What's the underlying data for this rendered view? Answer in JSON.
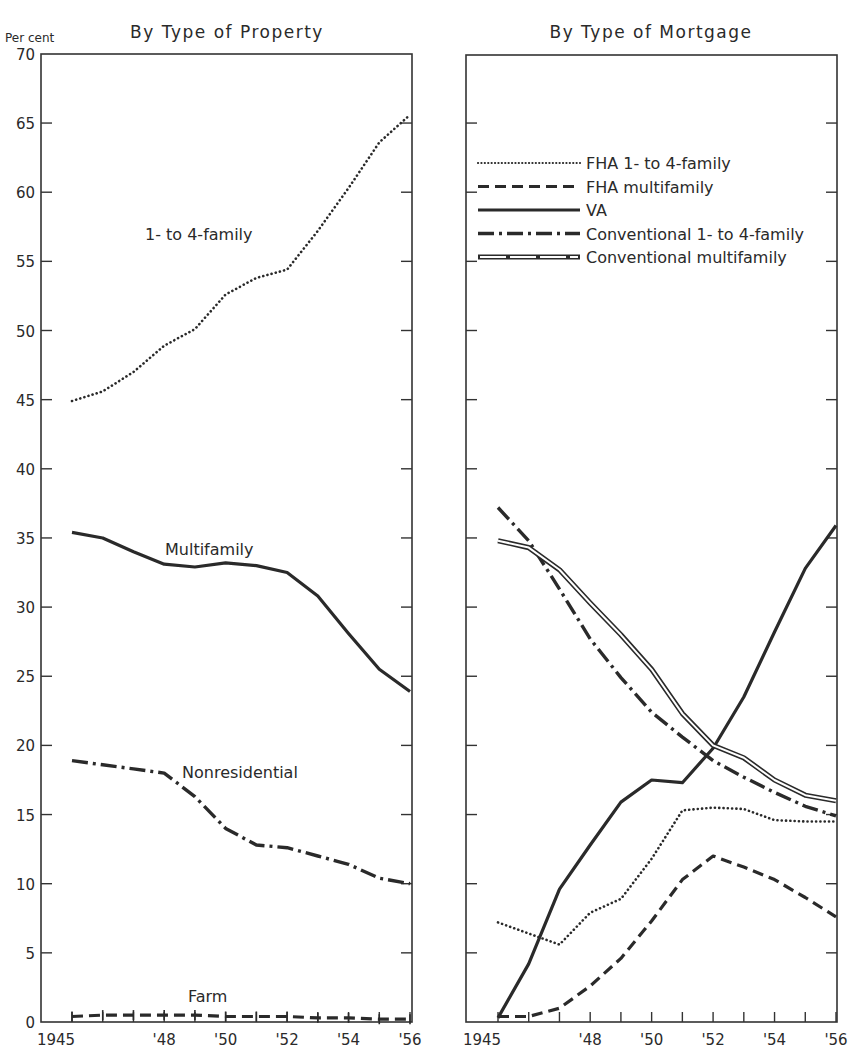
{
  "figure": {
    "panels": [
      {
        "title": "By Type of Property",
        "ylabel": "Per cent"
      },
      {
        "title": "By Type of Mortgage"
      }
    ]
  },
  "chart_data": [
    {
      "type": "line",
      "title": "By Type of Property",
      "xlabel": "",
      "ylabel": "Per cent",
      "x": [
        1945,
        1946,
        1947,
        1948,
        1949,
        1950,
        1951,
        1952,
        1953,
        1954,
        1955,
        1956
      ],
      "xtick_labels": [
        "1945",
        "'48",
        "'50",
        "'52",
        "'54",
        "'56"
      ],
      "xtick_label_years": [
        1945,
        1948,
        1950,
        1952,
        1954,
        1956
      ],
      "ylim": [
        0,
        70
      ],
      "yticks": [
        0,
        5,
        10,
        15,
        20,
        25,
        30,
        35,
        40,
        45,
        50,
        55,
        60,
        65,
        70
      ],
      "grid": false,
      "legend": "inline labels",
      "series": [
        {
          "name": "1- to 4-family",
          "style": "dotted",
          "label_pos": [
            145,
            240
          ],
          "values": [
            44.9,
            45.6,
            47.0,
            48.9,
            50.1,
            52.6,
            53.8,
            54.4,
            57.2,
            60.3,
            63.6,
            65.6
          ]
        },
        {
          "name": "Multifamily",
          "style": "solid",
          "label_pos": [
            165,
            555
          ],
          "values": [
            35.4,
            35.0,
            34.0,
            33.1,
            32.9,
            33.2,
            33.0,
            32.5,
            30.8,
            28.1,
            25.5,
            23.9
          ]
        },
        {
          "name": "Nonresidential",
          "style": "dashdot",
          "label_pos": [
            182,
            778
          ],
          "values": [
            18.9,
            18.6,
            18.3,
            18.0,
            16.3,
            14.0,
            12.8,
            12.6,
            12.0,
            11.4,
            10.4,
            10.0
          ]
        },
        {
          "name": "Farm",
          "style": "dashed",
          "label_pos": [
            188,
            1002
          ],
          "values": [
            0.4,
            0.5,
            0.5,
            0.5,
            0.5,
            0.4,
            0.4,
            0.4,
            0.3,
            0.3,
            0.2,
            0.2
          ]
        }
      ]
    },
    {
      "type": "line",
      "title": "By Type of Mortgage",
      "xlabel": "",
      "ylabel": "Per cent",
      "x": [
        1945,
        1946,
        1947,
        1948,
        1949,
        1950,
        1951,
        1952,
        1953,
        1954,
        1955,
        1956
      ],
      "xtick_labels": [
        "1945",
        "'48",
        "'50",
        "'52",
        "'54",
        "'56"
      ],
      "xtick_label_years": [
        1945,
        1948,
        1950,
        1952,
        1954,
        1956
      ],
      "ylim": [
        0,
        70
      ],
      "grid": false,
      "legend": "upper right",
      "series": [
        {
          "name": "FHA 1- to 4-family",
          "style": "dotted",
          "values": [
            7.2,
            6.4,
            5.6,
            7.9,
            8.9,
            11.8,
            15.3,
            15.5,
            15.4,
            14.6,
            14.5,
            14.5
          ]
        },
        {
          "name": "FHA multifamily",
          "style": "dashed",
          "values": [
            0.4,
            0.4,
            1.0,
            2.6,
            4.6,
            7.3,
            10.3,
            12.0,
            11.2,
            10.3,
            9.0,
            7.6
          ]
        },
        {
          "name": "VA",
          "style": "solid",
          "values": [
            0.3,
            4.2,
            9.6,
            12.8,
            15.9,
            17.5,
            17.3,
            19.8,
            23.5,
            28.2,
            32.8,
            35.9
          ]
        },
        {
          "name": "Conventional 1- to 4-family",
          "style": "dashdot",
          "values": [
            37.2,
            34.8,
            31.3,
            27.7,
            24.9,
            22.4,
            20.6,
            18.9,
            17.7,
            16.6,
            15.6,
            14.9
          ]
        },
        {
          "name": "Conventional multifamily",
          "style": "double",
          "values": [
            34.8,
            34.3,
            32.7,
            30.3,
            28.0,
            25.5,
            22.3,
            20.0,
            19.1,
            17.5,
            16.4,
            16.0
          ]
        }
      ]
    }
  ]
}
